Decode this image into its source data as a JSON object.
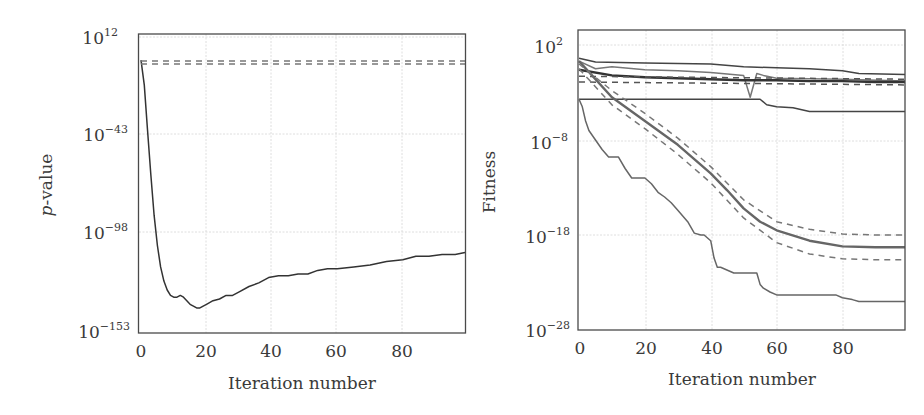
{
  "chart_data": [
    {
      "type": "line",
      "title": "",
      "xlabel": "Iteration number",
      "ylabel": "p-value",
      "ylabel_italic_prefix": "p",
      "ylabel_suffix": "-value",
      "yscale": "log",
      "xlim": [
        0,
        99
      ],
      "ylim_exponents": [
        -153,
        12
      ],
      "xticks": [
        "0",
        "20",
        "40",
        "60",
        "80"
      ],
      "yticks": [
        {
          "base": "10",
          "exp": "12"
        },
        {
          "base": "10",
          "exp": "−43"
        },
        {
          "base": "10",
          "exp": "−98"
        },
        {
          "base": "10",
          "exp": "−153"
        }
      ],
      "grid": true,
      "series": [
        {
          "name": "p-value",
          "style": "solid",
          "color": "#333333",
          "x": [
            0,
            1,
            2,
            3,
            4,
            5,
            6,
            7,
            8,
            9,
            10,
            11,
            12,
            13,
            14,
            15,
            16,
            17,
            18,
            19,
            20,
            22,
            24,
            26,
            28,
            30,
            33,
            36,
            39,
            42,
            45,
            48,
            51,
            54,
            57,
            60,
            65,
            70,
            75,
            80,
            84,
            88,
            92,
            96,
            99
          ],
          "log10_y": [
            -1,
            -15,
            -40,
            -65,
            -88,
            -105,
            -117,
            -125,
            -130,
            -133,
            -134,
            -134,
            -133,
            -134,
            -136,
            -138,
            -139,
            -140,
            -140,
            -139,
            -138,
            -136,
            -135,
            -133,
            -133,
            -131,
            -128,
            -126,
            -123,
            -122,
            -122,
            -121,
            -121,
            -119,
            -118,
            -118,
            -117,
            -116,
            -114,
            -113,
            -111,
            -111,
            -110,
            -110,
            -109
          ]
        },
        {
          "name": "threshold upper",
          "style": "dashed",
          "color": "#777777",
          "x": [
            0,
            99
          ],
          "log10_y": [
            -1.5,
            -1.5
          ]
        },
        {
          "name": "threshold lower",
          "style": "dashed",
          "color": "#777777",
          "x": [
            0,
            99
          ],
          "log10_y": [
            -3.2,
            -3.2
          ]
        }
      ]
    },
    {
      "type": "line",
      "title": "",
      "xlabel": "Iteration number",
      "ylabel": "Fitness",
      "yscale": "log",
      "xlim": [
        0,
        99
      ],
      "ylim_exponents": [
        -28,
        3.6
      ],
      "xticks": [
        "0",
        "20",
        "40",
        "60",
        "80"
      ],
      "yticks": [
        {
          "base": "10",
          "exp": "2"
        },
        {
          "base": "10",
          "exp": "−8"
        },
        {
          "base": "10",
          "exp": "−18"
        },
        {
          "base": "10",
          "exp": "−28"
        }
      ],
      "grid": true,
      "series": [
        {
          "name": "top solid",
          "style": "solid",
          "color": "#444444",
          "x": [
            0,
            5,
            20,
            40,
            50,
            60,
            70,
            80,
            85,
            99
          ],
          "log10_y": [
            0.6,
            0.2,
            0.1,
            0.0,
            -0.3,
            -0.4,
            -0.5,
            -0.7,
            -1.0,
            -1.1
          ]
        },
        {
          "name": "mid solid (with dip)",
          "style": "solid",
          "color": "#777777",
          "x": [
            0,
            5,
            10,
            20,
            30,
            40,
            50,
            52,
            54,
            56,
            60,
            80,
            99
          ],
          "log10_y": [
            0.3,
            -0.5,
            -0.3,
            -0.6,
            -0.7,
            -0.9,
            -1.2,
            -3.5,
            -1.0,
            -1.2,
            -1.5,
            -1.6,
            -1.8
          ]
        },
        {
          "name": "mean bold",
          "style": "solid-bold",
          "color": "#333333",
          "x": [
            0,
            10,
            20,
            30,
            40,
            50,
            60,
            70,
            80,
            90,
            99
          ],
          "log10_y": [
            -0.6,
            -1.2,
            -1.4,
            -1.5,
            -1.6,
            -1.7,
            -1.7,
            -1.8,
            -1.8,
            -1.9,
            -1.9
          ]
        },
        {
          "name": "mean dashed upper",
          "style": "dashed",
          "color": "#555555",
          "x": [
            0,
            99
          ],
          "log10_y": [
            -1.3,
            -1.6
          ]
        },
        {
          "name": "mean dashed lower",
          "style": "dashed",
          "color": "#555555",
          "x": [
            0,
            99
          ],
          "log10_y": [
            -1.9,
            -2.2
          ]
        },
        {
          "name": "flat low",
          "style": "solid",
          "color": "#444444",
          "x": [
            0,
            55,
            57,
            60,
            65,
            70,
            99
          ],
          "log10_y": [
            -3.7,
            -3.7,
            -4.3,
            -4.5,
            -4.6,
            -5.0,
            -5.0
          ]
        },
        {
          "name": "converging mean",
          "style": "solid-bold",
          "color": "#666666",
          "x": [
            0,
            10,
            20,
            30,
            40,
            45,
            50,
            55,
            60,
            70,
            80,
            90,
            99
          ],
          "log10_y": [
            0.3,
            -3.5,
            -6.0,
            -8.5,
            -11.5,
            -13.3,
            -15.2,
            -16.6,
            -17.5,
            -18.6,
            -19.2,
            -19.3,
            -19.3
          ]
        },
        {
          "name": "converging upper",
          "style": "dashed",
          "color": "#777777",
          "x": [
            0,
            10,
            20,
            30,
            40,
            50,
            60,
            70,
            80,
            90,
            99
          ],
          "log10_y": [
            0.0,
            -2.8,
            -5.2,
            -7.8,
            -10.8,
            -14.3,
            -16.6,
            -17.4,
            -17.9,
            -18.0,
            -18.0
          ]
        },
        {
          "name": "converging lower",
          "style": "dashed",
          "color": "#777777",
          "x": [
            0,
            10,
            20,
            30,
            40,
            50,
            60,
            70,
            80,
            90,
            99
          ],
          "log10_y": [
            -0.5,
            -4.3,
            -6.8,
            -9.5,
            -12.5,
            -16.2,
            -18.8,
            -20.0,
            -20.5,
            -20.6,
            -20.6
          ]
        },
        {
          "name": "best",
          "style": "solid",
          "color": "#666666",
          "x": [
            0,
            1,
            2,
            3,
            5,
            7,
            9,
            12,
            14,
            16,
            20,
            22,
            24,
            26,
            28,
            30,
            33,
            35,
            37,
            38,
            40,
            41,
            42,
            43,
            47,
            48,
            54,
            55,
            56,
            58,
            60,
            62,
            78,
            80,
            83,
            85,
            99
          ],
          "log10_y": [
            -3.7,
            -4.5,
            -6.0,
            -7.0,
            -8.0,
            -9.0,
            -9.8,
            -9.8,
            -11.0,
            -12.0,
            -12.0,
            -12.6,
            -13.5,
            -14.0,
            -14.6,
            -15.4,
            -16.6,
            -17.8,
            -18.0,
            -18.0,
            -18.6,
            -20.4,
            -21.4,
            -21.4,
            -22.0,
            -22.0,
            -22.0,
            -23.2,
            -23.6,
            -24.0,
            -24.3,
            -24.3,
            -24.3,
            -24.6,
            -24.8,
            -25.0,
            -25.0
          ]
        }
      ]
    }
  ]
}
